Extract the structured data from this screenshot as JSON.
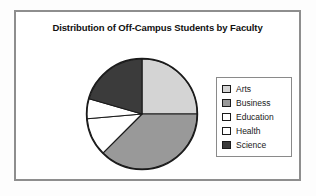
{
  "chart_data": {
    "type": "pie",
    "title": "Distribution of Off-Campus Students by Faculty",
    "xlabel": "",
    "ylabel": "",
    "legend_position": "right",
    "grid": false,
    "start_angle_deg": 0,
    "direction": "clockwise",
    "categories": [
      "Arts",
      "Business",
      "Education",
      "Health",
      "Science"
    ],
    "values": [
      25,
      37.5,
      11,
      6,
      20.5
    ],
    "slices": [
      {
        "label": "Arts",
        "value": 25,
        "color": "#d4d4d4",
        "start_deg": 0,
        "end_deg": 90
      },
      {
        "label": "Business",
        "value": 37.5,
        "color": "#999999",
        "start_deg": 90,
        "end_deg": 225
      },
      {
        "label": "Education",
        "value": 11,
        "color": "#ffffff",
        "start_deg": 225,
        "end_deg": 265
      },
      {
        "label": "Health",
        "value": 6,
        "color": "#ffffff",
        "start_deg": 265,
        "end_deg": 286
      },
      {
        "label": "Science",
        "value": 20.5,
        "color": "#3b3b3b",
        "start_deg": 286,
        "end_deg": 360
      }
    ]
  },
  "chart": {
    "title": "Distribution of Off-Campus Students by Faculty",
    "outline_color": "#1a1a1a"
  },
  "legend": {
    "items": [
      {
        "label": "Arts",
        "color": "#d4d4d4"
      },
      {
        "label": "Business",
        "color": "#999999"
      },
      {
        "label": "Education",
        "color": "#ffffff"
      },
      {
        "label": "Health",
        "color": "#ffffff"
      },
      {
        "label": "Science",
        "color": "#3b3b3b"
      }
    ]
  }
}
